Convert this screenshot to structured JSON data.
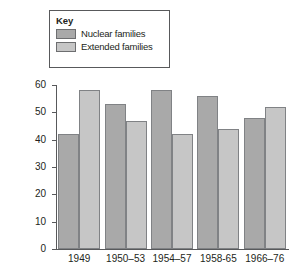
{
  "chart_data": {
    "type": "bar",
    "title": "",
    "subtitle": "",
    "xlabel": "",
    "ylabel": "% Death rates per 1,000 people",
    "categories": [
      "1949",
      "1950–53",
      "1954–57",
      "1958-65",
      "1966–76"
    ],
    "series": [
      {
        "name": "Nuclear families",
        "values": [
          42,
          53,
          58,
          56,
          48
        ],
        "color": "#a9a9a9"
      },
      {
        "name": "Extended families",
        "values": [
          58,
          47,
          42,
          44,
          52
        ],
        "color": "#c6c6c6"
      }
    ],
    "ylim": [
      0,
      60
    ],
    "yticks": [
      0,
      10,
      20,
      30,
      40,
      50,
      60
    ],
    "ytick_labels": [
      "0",
      "10",
      "20",
      "30",
      "40",
      "50",
      "60"
    ],
    "grid": false,
    "legend_position": "top-left",
    "legend": {
      "title": "Key",
      "entries": [
        "Nuclear families",
        "Extended families"
      ]
    }
  },
  "axis": {
    "y_title": "% Death rates per 1,000 people"
  }
}
